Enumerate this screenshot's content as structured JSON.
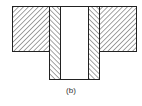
{
  "figure": {
    "caption": "(b)",
    "colors": {
      "stroke": "#222222",
      "hatch": "#333333",
      "background": "#ffffff"
    }
  }
}
